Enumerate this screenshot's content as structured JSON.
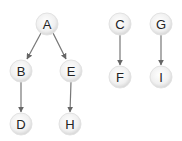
{
  "diagram": {
    "type": "directed-graph",
    "colors": {
      "node_fill_center": "#ffffff",
      "node_fill_edge": "#dcdcdc",
      "node_stroke": "#e4e4e4",
      "edge": "#666666",
      "label": "#222222"
    },
    "nodes": [
      {
        "id": "A",
        "label": "A",
        "x": 47,
        "y": 24
      },
      {
        "id": "B",
        "label": "B",
        "x": 21,
        "y": 71
      },
      {
        "id": "E",
        "label": "E",
        "x": 71,
        "y": 71
      },
      {
        "id": "D",
        "label": "D",
        "x": 21,
        "y": 124
      },
      {
        "id": "H",
        "label": "H",
        "x": 70,
        "y": 124
      },
      {
        "id": "C",
        "label": "C",
        "x": 120,
        "y": 24
      },
      {
        "id": "G",
        "label": "G",
        "x": 161,
        "y": 24
      },
      {
        "id": "F",
        "label": "F",
        "x": 120,
        "y": 77
      },
      {
        "id": "I",
        "label": "I",
        "x": 161,
        "y": 77
      }
    ],
    "edges": [
      {
        "from": "A",
        "to": "B"
      },
      {
        "from": "A",
        "to": "E"
      },
      {
        "from": "B",
        "to": "D"
      },
      {
        "from": "E",
        "to": "H"
      },
      {
        "from": "C",
        "to": "F"
      },
      {
        "from": "G",
        "to": "I"
      }
    ]
  }
}
